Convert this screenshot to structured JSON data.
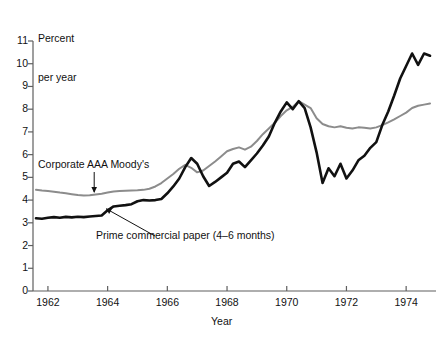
{
  "chart_data": {
    "type": "line",
    "title": "",
    "ylabel": "Percent\nper year",
    "xlabel": "Year",
    "ylim": [
      0,
      11
    ],
    "xlim": [
      1961.5,
      1975.0
    ],
    "yticks": [
      0,
      1,
      2,
      3,
      4,
      5,
      6,
      7,
      8,
      9,
      10,
      11
    ],
    "ytick_labels": [
      "0",
      "1",
      "2",
      "3",
      "4",
      "5",
      "6",
      "7",
      "8",
      "9",
      "10",
      "11"
    ],
    "xticks": [
      1962,
      1964,
      1966,
      1968,
      1970,
      1972,
      1974
    ],
    "xtick_labels": [
      "1962",
      "1964",
      "1966",
      "1968",
      "1970",
      "1972",
      "1974"
    ],
    "grid": false,
    "legend_position": "inline-annotations",
    "annotations": [
      {
        "name": "corporate-aaa-label",
        "text": "Corporate AAA Moody's",
        "series": "Corporate AAA Moody's"
      },
      {
        "name": "prime-paper-label",
        "text": "Prime commercial paper (4–6 months)",
        "series": "Prime commercial paper (4-6 months)"
      }
    ],
    "series": [
      {
        "name": "Corporate AAA Moody's",
        "color": "#8c8c8c",
        "linewidth": 2.0,
        "x": [
          1961.6,
          1961.8,
          1962.0,
          1962.2,
          1962.4,
          1962.6,
          1962.8,
          1963.0,
          1963.2,
          1963.4,
          1963.6,
          1963.8,
          1964.0,
          1964.2,
          1964.4,
          1964.6,
          1964.8,
          1965.0,
          1965.2,
          1965.4,
          1965.6,
          1965.8,
          1966.0,
          1966.2,
          1966.4,
          1966.6,
          1966.8,
          1967.0,
          1967.2,
          1967.4,
          1967.6,
          1967.8,
          1968.0,
          1968.2,
          1968.4,
          1968.6,
          1968.8,
          1969.0,
          1969.2,
          1969.4,
          1969.6,
          1969.8,
          1970.0,
          1970.2,
          1970.4,
          1970.6,
          1970.8,
          1971.0,
          1971.2,
          1971.4,
          1971.6,
          1971.8,
          1972.0,
          1972.2,
          1972.4,
          1972.6,
          1972.8,
          1973.0,
          1973.2,
          1973.4,
          1973.6,
          1973.8,
          1974.0,
          1974.2,
          1974.4,
          1974.6,
          1974.8
        ],
        "y": [
          4.45,
          4.42,
          4.4,
          4.37,
          4.33,
          4.3,
          4.26,
          4.22,
          4.2,
          4.21,
          4.25,
          4.28,
          4.33,
          4.38,
          4.4,
          4.41,
          4.42,
          4.43,
          4.45,
          4.5,
          4.6,
          4.75,
          4.95,
          5.15,
          5.38,
          5.55,
          5.42,
          5.22,
          5.3,
          5.5,
          5.7,
          5.92,
          6.15,
          6.25,
          6.32,
          6.22,
          6.35,
          6.6,
          6.9,
          7.15,
          7.4,
          7.7,
          7.95,
          8.1,
          8.35,
          8.2,
          8.05,
          7.6,
          7.35,
          7.25,
          7.2,
          7.25,
          7.18,
          7.15,
          7.2,
          7.18,
          7.15,
          7.2,
          7.3,
          7.42,
          7.55,
          7.7,
          7.85,
          8.05,
          8.15,
          8.2,
          8.25
        ]
      },
      {
        "name": "Prime commercial paper (4-6 months)",
        "color": "#111111",
        "linewidth": 2.6,
        "x": [
          1961.6,
          1961.8,
          1962.0,
          1962.2,
          1962.4,
          1962.6,
          1962.8,
          1963.0,
          1963.2,
          1963.4,
          1963.6,
          1963.8,
          1964.0,
          1964.2,
          1964.4,
          1964.6,
          1964.8,
          1965.0,
          1965.2,
          1965.4,
          1965.6,
          1965.8,
          1966.0,
          1966.2,
          1966.4,
          1966.6,
          1966.8,
          1967.0,
          1967.2,
          1967.4,
          1967.6,
          1967.8,
          1968.0,
          1968.2,
          1968.4,
          1968.6,
          1968.8,
          1969.0,
          1969.2,
          1969.4,
          1969.6,
          1969.8,
          1970.0,
          1970.2,
          1970.4,
          1970.6,
          1970.8,
          1971.0,
          1971.2,
          1971.4,
          1971.6,
          1971.8,
          1972.0,
          1972.2,
          1972.4,
          1972.6,
          1972.8,
          1973.0,
          1973.2,
          1973.4,
          1973.6,
          1973.8,
          1974.0,
          1974.2,
          1974.4,
          1974.6,
          1974.8
        ],
        "y": [
          3.2,
          3.18,
          3.22,
          3.25,
          3.22,
          3.26,
          3.24,
          3.27,
          3.25,
          3.28,
          3.3,
          3.32,
          3.55,
          3.72,
          3.75,
          3.78,
          3.82,
          3.95,
          4.0,
          3.98,
          4.0,
          4.05,
          4.3,
          4.6,
          4.95,
          5.45,
          5.85,
          5.6,
          5.05,
          4.62,
          4.8,
          5.0,
          5.2,
          5.6,
          5.7,
          5.45,
          5.75,
          6.05,
          6.4,
          6.8,
          7.4,
          7.9,
          8.3,
          8.0,
          8.35,
          8.05,
          7.2,
          6.1,
          4.75,
          5.4,
          5.05,
          5.6,
          4.95,
          5.3,
          5.75,
          5.95,
          6.3,
          6.55,
          7.3,
          7.9,
          8.6,
          9.35,
          9.9,
          10.45,
          9.95,
          10.45,
          10.35
        ]
      }
    ]
  },
  "axes": {
    "y_title_line1": "Percent",
    "y_title_line2": "per year",
    "x_title": "Year"
  }
}
